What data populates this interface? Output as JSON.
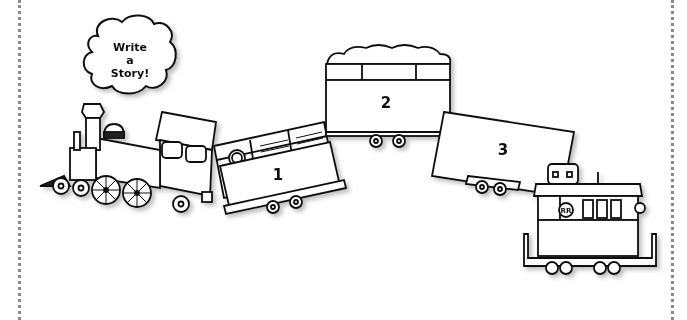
{
  "worksheet": {
    "bubble": {
      "lines": [
        "Write",
        "a",
        "Story!"
      ]
    },
    "engine": {
      "label": "locomotive"
    },
    "cars": [
      {
        "number": "1",
        "type": "boxcar"
      },
      {
        "number": "2",
        "type": "hopper"
      },
      {
        "number": "3",
        "type": "flatcar"
      }
    ],
    "caboose": {
      "emblem": "RR"
    },
    "colors": {
      "ink": "#111111",
      "paper": "#ffffff",
      "border": "#8a8a8a"
    }
  }
}
